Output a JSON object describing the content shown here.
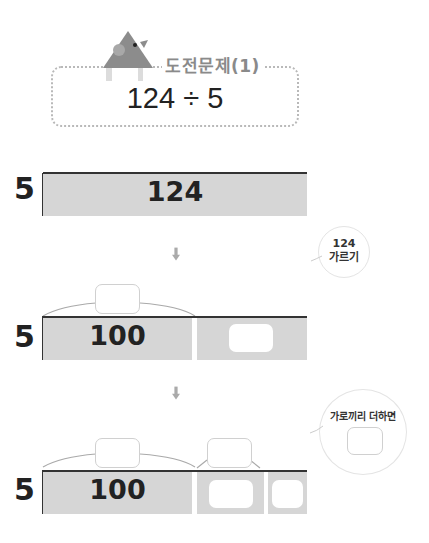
{
  "header": {
    "title": "도전문제(1)",
    "expression": "124 ÷ 5",
    "mascot_icon": "triangle-bird-mascot-icon"
  },
  "colors": {
    "bar_fill": "#d6d6d6",
    "bar_top_line": "#333333",
    "title_text": "#8a8a8a",
    "dotted_border": "#b9b9b9",
    "mascot": "#8c8c8c"
  },
  "step1": {
    "divisor": "5",
    "bar_value": "124"
  },
  "step2": {
    "divisor": "5",
    "bar_value": "100",
    "bubble_text_line1": "124",
    "bubble_text_line2": "가르기",
    "answer_boxes": [
      "",
      ""
    ]
  },
  "step3": {
    "divisor": "5",
    "bar_value": "100",
    "bubble_text": "가로끼리 더하면",
    "answer_boxes": [
      "",
      "",
      "",
      "",
      ""
    ]
  },
  "arrows": [
    "down-arrow-icon",
    "down-arrow-icon"
  ]
}
